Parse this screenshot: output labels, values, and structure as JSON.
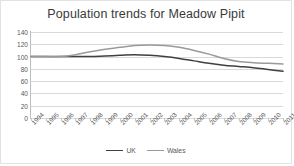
{
  "chart_data": {
    "type": "line",
    "title": "Population trends for Meadow Pipit",
    "xlabel": "",
    "ylabel": "",
    "ylim": [
      0,
      140
    ],
    "yticks": [
      0,
      20,
      40,
      60,
      80,
      100,
      120,
      140
    ],
    "grid": true,
    "legend_position": "bottom",
    "categories": [
      "1994",
      "1995",
      "1996",
      "1997",
      "1998",
      "1999",
      "2000",
      "2001",
      "2002",
      "2003",
      "2004",
      "2005",
      "2006",
      "2007",
      "2008",
      "2009",
      "2010",
      "2011"
    ],
    "series": [
      {
        "name": "UK",
        "color": "#404040",
        "values": [
          100,
          100,
          100,
          100,
          100,
          101,
          102,
          103,
          102,
          100,
          97,
          93,
          89,
          86,
          84,
          82,
          79,
          76
        ]
      },
      {
        "name": "Wales",
        "color": "#9a9a9a",
        "values": [
          100,
          100,
          100,
          103,
          108,
          112,
          115,
          118,
          119,
          118,
          115,
          110,
          104,
          97,
          92,
          90,
          89,
          88
        ]
      }
    ]
  },
  "legend": {
    "items": [
      {
        "label": "UK",
        "color": "#404040"
      },
      {
        "label": "Wales",
        "color": "#9a9a9a"
      }
    ]
  },
  "colors": {
    "title": "#3a3a3a",
    "axis_text": "#595959",
    "gridline": "#d9d9d9",
    "border": "#e2e2e2",
    "background": "#ffffff",
    "series_uk": "#404040",
    "series_wales": "#9a9a9a"
  }
}
